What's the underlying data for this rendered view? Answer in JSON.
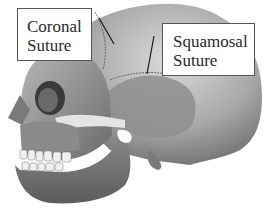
{
  "figure": {
    "labels": [
      {
        "id": "coronal",
        "lines": [
          "Coronal",
          "Suture"
        ]
      },
      {
        "id": "squamosal",
        "lines": [
          "Squamosal",
          "Suture"
        ]
      }
    ],
    "small_engraved_labels": [
      "Zygomatic",
      "Temporal"
    ],
    "colors": {
      "background": "#ffffff",
      "bone_light": "#d9d9d9",
      "bone_mid": "#9a9a9a",
      "bone_dark": "#5a5a5a",
      "box_border": "#555555",
      "pointer_line": "#1a1a1a"
    }
  }
}
